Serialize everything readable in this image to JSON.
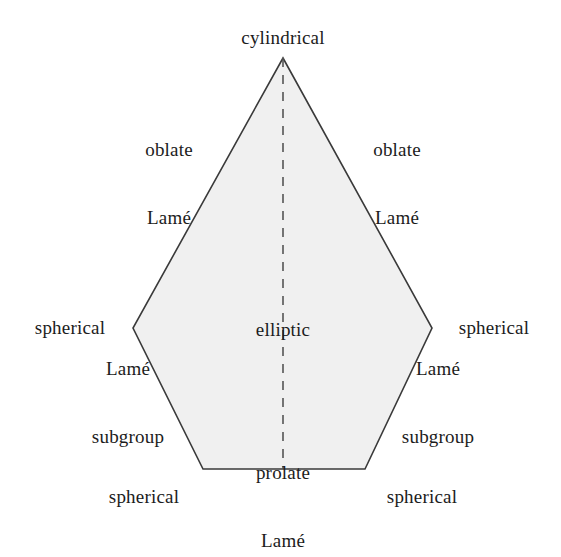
{
  "figure": {
    "type": "classification-pentagon-diagram",
    "background_color": "#ffffff",
    "shape": {
      "name": "coordinate-systems-region",
      "fill_color": "#f0f0f0",
      "stroke_color": "#3a3a3a",
      "vertices": [
        {
          "name": "apex-top",
          "x": 283,
          "y": 58
        },
        {
          "name": "vertex-right",
          "x": 432,
          "y": 328
        },
        {
          "name": "vertex-bottom-right",
          "x": 365,
          "y": 469
        },
        {
          "name": "vertex-bottom-left",
          "x": 203,
          "y": 469
        },
        {
          "name": "vertex-left",
          "x": 133,
          "y": 328
        }
      ]
    },
    "symmetry_axis": {
      "name": "dashed-center-line",
      "x": 283,
      "y_start": 58,
      "y_end": 469,
      "style": "dashed",
      "dash_length": 9,
      "gap_length": 8,
      "color": "#555555"
    }
  },
  "labels": {
    "top": "cylindrical",
    "interior": "elliptic",
    "upper_left": {
      "line1": "oblate",
      "line2": "Lamé"
    },
    "upper_right": {
      "line1": "oblate",
      "line2": "Lamé"
    },
    "middle_left": "spherical",
    "middle_right": "spherical",
    "lower_left": {
      "line1": "Lamé",
      "line2": "subgroup"
    },
    "lower_right": {
      "line1": "Lamé",
      "line2": "subgroup"
    },
    "bottom_left": "spherical",
    "bottom_right": "spherical",
    "bottom_center": {
      "line1": "prolate",
      "line2": "Lamé"
    }
  }
}
